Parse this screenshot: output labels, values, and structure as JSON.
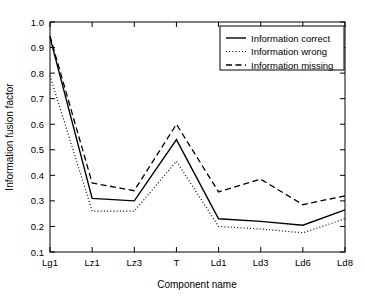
{
  "chart_data": {
    "type": "line",
    "title": "",
    "xlabel": "Component name",
    "ylabel": "Information fusion factor",
    "categories": [
      "Lg1",
      "Lz1",
      "Lz3",
      "T",
      "Ld1",
      "Ld3",
      "Ld6",
      "Ld8"
    ],
    "ylim": [
      0.1,
      1.0
    ],
    "ytick_labels": [
      "0.1",
      "0.2",
      "0.3",
      "0.4",
      "0.5",
      "0.6",
      "0.7",
      "0.8",
      "0.9",
      "1.0"
    ],
    "ytick_values": [
      0.1,
      0.2,
      0.3,
      0.4,
      0.5,
      0.6,
      0.7,
      0.8,
      0.9,
      1.0
    ],
    "grid": false,
    "legend_position": "top-right",
    "series": [
      {
        "name": "Information correct",
        "style": "solid",
        "color": "#000000",
        "values": [
          0.94,
          0.31,
          0.3,
          0.54,
          0.23,
          0.22,
          0.205,
          0.265
        ]
      },
      {
        "name": "Information wrong",
        "style": "dotted",
        "color": "#000000",
        "values": [
          0.79,
          0.26,
          0.26,
          0.455,
          0.2,
          0.19,
          0.175,
          0.23
        ]
      },
      {
        "name": "Information missing",
        "style": "dashed",
        "color": "#000000",
        "values": [
          0.945,
          0.37,
          0.34,
          0.6,
          0.335,
          0.385,
          0.285,
          0.32
        ]
      }
    ]
  }
}
